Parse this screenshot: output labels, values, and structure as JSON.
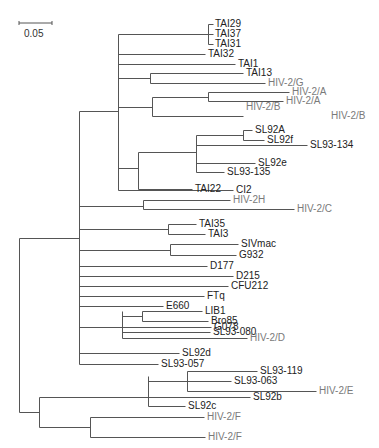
{
  "figure": {
    "type": "phylogenetic-tree",
    "scale_bar": {
      "label": "0.05",
      "x1": 19,
      "x2": 52,
      "y": 23
    },
    "colors": {
      "line": "#555555",
      "label": "#222222",
      "reference_label": "#7a7a7a"
    }
  },
  "edges": [
    [
      19,
      238,
      19,
      412
    ],
    [
      19,
      238,
      79,
      238
    ],
    [
      19,
      412,
      39,
      412
    ],
    [
      79,
      111,
      79,
      364
    ],
    [
      79,
      111,
      118,
      111
    ],
    [
      118,
      34,
      118,
      190
    ],
    [
      118,
      34,
      208,
      34
    ],
    [
      208,
      24,
      208,
      44
    ],
    [
      208,
      24,
      213,
      24
    ],
    [
      208,
      34,
      213,
      34
    ],
    [
      208,
      44,
      213,
      44
    ],
    [
      118,
      54,
      205,
      54
    ],
    [
      118,
      64,
      235,
      64
    ],
    [
      118,
      78,
      150,
      78
    ],
    [
      150,
      73,
      150,
      83
    ],
    [
      150,
      73,
      243,
      73
    ],
    [
      150,
      83,
      265,
      83
    ],
    [
      118,
      107,
      152,
      107
    ],
    [
      152,
      97,
      152,
      116
    ],
    [
      152,
      97,
      208,
      97
    ],
    [
      152,
      116,
      243,
      116
    ],
    [
      208,
      92,
      208,
      101
    ],
    [
      208,
      92,
      289,
      92
    ],
    [
      208,
      101,
      283,
      101
    ],
    [
      118,
      168,
      138,
      168
    ],
    [
      138,
      152,
      138,
      189
    ],
    [
      138,
      152,
      196,
      152
    ],
    [
      138,
      189,
      192,
      189
    ],
    [
      196,
      135,
      196,
      172
    ],
    [
      196,
      135,
      243,
      135
    ],
    [
      243,
      130,
      243,
      140
    ],
    [
      243,
      130,
      252,
      130
    ],
    [
      243,
      140,
      264,
      140
    ],
    [
      196,
      145,
      307,
      145
    ],
    [
      196,
      163,
      255,
      163
    ],
    [
      196,
      172,
      224,
      172
    ],
    [
      118,
      190,
      233,
      190
    ],
    [
      79,
      206,
      143,
      206
    ],
    [
      143,
      200,
      143,
      209
    ],
    [
      143,
      200,
      230,
      200
    ],
    [
      143,
      209,
      294,
      209
    ],
    [
      79,
      229,
      168,
      229
    ],
    [
      168,
      224,
      168,
      234
    ],
    [
      168,
      224,
      196,
      224
    ],
    [
      168,
      234,
      205,
      234
    ],
    [
      79,
      250,
      170,
      250
    ],
    [
      170,
      244,
      170,
      255
    ],
    [
      170,
      244,
      238,
      244
    ],
    [
      170,
      255,
      236,
      255
    ],
    [
      79,
      266,
      207,
      266
    ],
    [
      79,
      276,
      233,
      276
    ],
    [
      79,
      286,
      228,
      286
    ],
    [
      79,
      296,
      204,
      296
    ],
    [
      79,
      306,
      163,
      306
    ],
    [
      79,
      327,
      122,
      327
    ],
    [
      122,
      311,
      122,
      338
    ],
    [
      122,
      316,
      142,
      316
    ],
    [
      142,
      311,
      142,
      321
    ],
    [
      142,
      311,
      202,
      311
    ],
    [
      142,
      321,
      208,
      321
    ],
    [
      122,
      327,
      211,
      327
    ],
    [
      122,
      332,
      210,
      332
    ],
    [
      122,
      338,
      247,
      338
    ],
    [
      79,
      353,
      179,
      353
    ],
    [
      79,
      364,
      158,
      364
    ],
    [
      39,
      397,
      39,
      427
    ],
    [
      39,
      397,
      148,
      397
    ],
    [
      148,
      376,
      148,
      406
    ],
    [
      148,
      381,
      187,
      381
    ],
    [
      187,
      371,
      187,
      391
    ],
    [
      187,
      371,
      257,
      371
    ],
    [
      187,
      381,
      231,
      381
    ],
    [
      187,
      391,
      316,
      391
    ],
    [
      148,
      397,
      250,
      397
    ],
    [
      148,
      406,
      185,
      406
    ],
    [
      39,
      427,
      90,
      427
    ],
    [
      90,
      417,
      90,
      437
    ],
    [
      90,
      417,
      204,
      417
    ],
    [
      90,
      437,
      205,
      437
    ]
  ],
  "leaves": [
    {
      "name": "TAI29",
      "x": 214,
      "y": 24,
      "ref": false
    },
    {
      "name": "TAI37",
      "x": 214,
      "y": 34,
      "ref": false
    },
    {
      "name": "TAI31",
      "x": 214,
      "y": 44,
      "ref": false
    },
    {
      "name": "TAI32",
      "x": 207,
      "y": 54,
      "ref": false
    },
    {
      "name": "TAI1",
      "x": 237,
      "y": 64,
      "ref": false
    },
    {
      "name": "TAI13",
      "x": 245,
      "y": 73,
      "ref": false
    },
    {
      "name": "HIV-2/G",
      "x": 267,
      "y": 83,
      "ref": true
    },
    {
      "name": "HIV-2/A",
      "x": 291,
      "y": 92,
      "ref": true
    },
    {
      "name": "HIV-2/A",
      "x": 285,
      "y": 101,
      "ref": true
    },
    {
      "name": "HIV-2/B",
      "x": 245,
      "y": 107,
      "ref": true
    },
    {
      "name": "HIV-2/B",
      "x": 330,
      "y": 116,
      "ref": true
    },
    {
      "name": "SL92A",
      "x": 254,
      "y": 130,
      "ref": false
    },
    {
      "name": "SL92f",
      "x": 266,
      "y": 140,
      "ref": false
    },
    {
      "name": "SL93-134",
      "x": 309,
      "y": 145,
      "ref": false
    },
    {
      "name": "SL92e",
      "x": 257,
      "y": 163,
      "ref": false
    },
    {
      "name": "SL93-135",
      "x": 226,
      "y": 172,
      "ref": false
    },
    {
      "name": "TAI22",
      "x": 194,
      "y": 189,
      "ref": false
    },
    {
      "name": "CI2",
      "x": 235,
      "y": 190,
      "ref": false
    },
    {
      "name": "HIV-2H",
      "x": 232,
      "y": 200,
      "ref": true
    },
    {
      "name": "HIV-2/C",
      "x": 296,
      "y": 209,
      "ref": true
    },
    {
      "name": "TAI35",
      "x": 198,
      "y": 224,
      "ref": false
    },
    {
      "name": "TAI3",
      "x": 207,
      "y": 234,
      "ref": false
    },
    {
      "name": "SIVmac",
      "x": 240,
      "y": 244,
      "ref": false
    },
    {
      "name": "G932",
      "x": 238,
      "y": 255,
      "ref": false
    },
    {
      "name": "D177",
      "x": 209,
      "y": 266,
      "ref": false
    },
    {
      "name": "D215",
      "x": 235,
      "y": 276,
      "ref": false
    },
    {
      "name": "CFU212",
      "x": 230,
      "y": 286,
      "ref": false
    },
    {
      "name": "FTq",
      "x": 206,
      "y": 296,
      "ref": false
    },
    {
      "name": "E660",
      "x": 165,
      "y": 306,
      "ref": false
    },
    {
      "name": "LIB1",
      "x": 204,
      "y": 311,
      "ref": false
    },
    {
      "name": "Bro85",
      "x": 210,
      "y": 321,
      "ref": false
    },
    {
      "name": "G078",
      "x": 213,
      "y": 327,
      "ref": false
    },
    {
      "name": "SL93-080",
      "x": 212,
      "y": 332,
      "ref": false
    },
    {
      "name": "HIV-2/D",
      "x": 249,
      "y": 338,
      "ref": true
    },
    {
      "name": "SL92d",
      "x": 181,
      "y": 353,
      "ref": false
    },
    {
      "name": "SL93-057",
      "x": 160,
      "y": 364,
      "ref": false
    },
    {
      "name": "SL93-119",
      "x": 259,
      "y": 371,
      "ref": false
    },
    {
      "name": "SL93-063",
      "x": 233,
      "y": 381,
      "ref": false
    },
    {
      "name": "HIV-2/E",
      "x": 318,
      "y": 391,
      "ref": true
    },
    {
      "name": "SL92b",
      "x": 252,
      "y": 397,
      "ref": false
    },
    {
      "name": "SL92c",
      "x": 187,
      "y": 406,
      "ref": false
    },
    {
      "name": "HIV-2/F",
      "x": 206,
      "y": 417,
      "ref": true
    },
    {
      "name": "HIV-2/F",
      "x": 207,
      "y": 437,
      "ref": true
    }
  ]
}
